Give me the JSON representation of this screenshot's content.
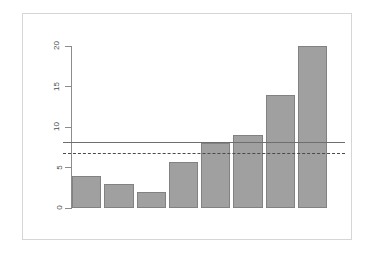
{
  "chart_data": {
    "type": "bar",
    "title": "",
    "subtitle": "",
    "xlabel": "",
    "ylabel": "",
    "categories": [
      "1",
      "2",
      "3",
      "4",
      "5",
      "6",
      "7",
      "8"
    ],
    "values": [
      4,
      3,
      2,
      5.7,
      8,
      9,
      14,
      20
    ],
    "series": [
      {
        "name": "counts",
        "values": [
          4,
          3,
          2,
          5.7,
          8,
          9,
          14,
          20
        ]
      }
    ],
    "ylim": [
      0,
      20.8
    ],
    "yticks": [
      0,
      5,
      10,
      15,
      20
    ],
    "ytick_labels": [
      "0",
      "5",
      "10",
      "15",
      "20"
    ],
    "xticks": [],
    "xtick_labels": [],
    "grid": false,
    "legend": "none",
    "legend_entries": [],
    "bar_color": "#a0a0a0",
    "bar_border_color": "#828282",
    "axis_color": "#8c8c8c",
    "background": "#ffffff",
    "frame_color": "#d6d6d6",
    "annotations": [
      {
        "name": "solid-reference-line",
        "type": "hline",
        "value": 8.1,
        "style": "solid",
        "color": "#6e6e6e",
        "label": ""
      },
      {
        "name": "dashed-reference-line",
        "type": "hline",
        "value": 6.8,
        "style": "dashed",
        "color": "#4a4a4a",
        "label": ""
      }
    ]
  }
}
